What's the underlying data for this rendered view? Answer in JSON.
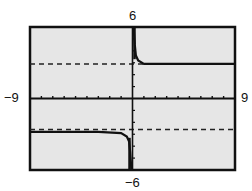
{
  "chart_data": {
    "type": "line",
    "title": "",
    "xlabel": "",
    "ylabel": "",
    "xlim": [
      -9,
      9
    ],
    "ylim": [
      -6,
      6
    ],
    "window_labels": {
      "xmin": "−9",
      "xmax": "9",
      "ymin": "−6",
      "ymax": "6"
    },
    "grid": false,
    "axis_ticks": {
      "x_step": 1,
      "y_step": 1
    },
    "series": [
      {
        "name": "f(x)",
        "style": "solid",
        "description": "Approaches y=-3 for x<0 and y=3 for x>0, with a steep transition near x=0",
        "x": [
          -9,
          -6,
          -3,
          -1,
          -0.5,
          -0.3,
          -0.2,
          -0.1,
          0,
          0.1,
          0.2,
          0.3,
          0.5,
          1,
          3,
          6,
          9
        ],
        "y": [
          -2.8,
          -2.8,
          -2.8,
          -2.9,
          -3.2,
          -3.6,
          -4.5,
          -6,
          0,
          6,
          4.5,
          3.6,
          3.2,
          2.9,
          2.9,
          2.9,
          2.9
        ]
      },
      {
        "name": "asymptote y=3",
        "style": "dashed",
        "x": [
          -9,
          9
        ],
        "y": [
          2.9,
          2.9
        ]
      },
      {
        "name": "asymptote y=-3",
        "style": "dashed",
        "x": [
          -9,
          9
        ],
        "y": [
          -2.6,
          -2.6
        ]
      }
    ],
    "colors": {
      "background": "#e8e8e8",
      "frame": "#111111",
      "curve": "#111111"
    }
  }
}
